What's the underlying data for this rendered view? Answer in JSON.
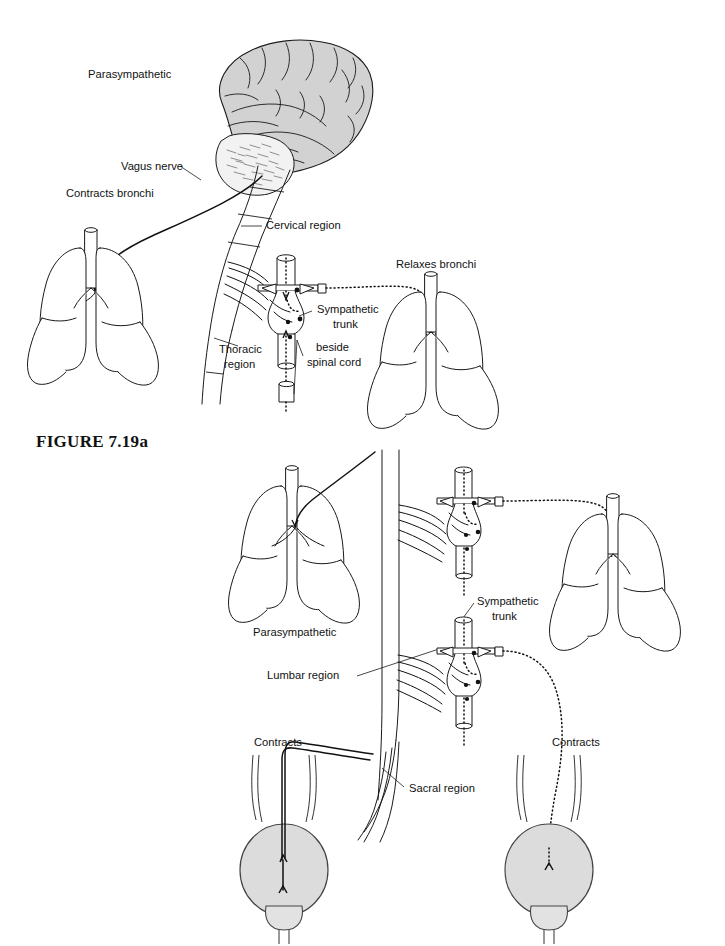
{
  "figure": {
    "caption": "FIGURE 7.19a",
    "caption_x": 36,
    "caption_y": 441
  },
  "panel_top": {
    "name": "respiratory-autonomic-panel",
    "labels": [
      {
        "id": "parasympathetic",
        "text": "Parasympathetic",
        "x": 88,
        "y": 75,
        "anchor": "start"
      },
      {
        "id": "vagus-nerve",
        "text": "Vagus nerve",
        "x": 121,
        "y": 167,
        "anchor": "start"
      },
      {
        "id": "contracts-bronchi",
        "text": "Contracts bronchi",
        "x": 66,
        "y": 194,
        "anchor": "start"
      },
      {
        "id": "cervical-region",
        "text": "Cervical region",
        "x": 266,
        "y": 226,
        "anchor": "start"
      },
      {
        "id": "thoracic-region-1",
        "text": "Thoracic",
        "x": 219,
        "y": 350,
        "anchor": "start"
      },
      {
        "id": "thoracic-region-2",
        "text": "region",
        "x": 224,
        "y": 365,
        "anchor": "start"
      },
      {
        "id": "relaxes-bronchi",
        "text": "Relaxes bronchi",
        "x": 396,
        "y": 265,
        "anchor": "start"
      },
      {
        "id": "sympathetic-trunk-1",
        "text": "Sympathetic",
        "x": 317,
        "y": 310,
        "anchor": "start"
      },
      {
        "id": "sympathetic-trunk-2",
        "text": "trunk",
        "x": 333,
        "y": 325,
        "anchor": "start"
      },
      {
        "id": "beside-spinal-1",
        "text": "beside",
        "x": 316,
        "y": 348,
        "anchor": "start"
      },
      {
        "id": "beside-spinal-2",
        "text": "spinal cord",
        "x": 307,
        "y": 363,
        "anchor": "start"
      }
    ]
  },
  "panel_bottom": {
    "name": "urinary-autonomic-panel",
    "labels": [
      {
        "id": "parasympathetic-b",
        "text": "Parasympathetic",
        "x": 253,
        "y": 633,
        "anchor": "start"
      },
      {
        "id": "lumbar-region",
        "text": "Lumbar region",
        "x": 267,
        "y": 676,
        "anchor": "start"
      },
      {
        "id": "sacral-region",
        "text": "Sacral region",
        "x": 409,
        "y": 789,
        "anchor": "start"
      },
      {
        "id": "contracts-left",
        "text": "Contracts",
        "x": 254,
        "y": 743,
        "anchor": "start"
      },
      {
        "id": "contracts-right",
        "text": "Contracts",
        "x": 552,
        "y": 743,
        "anchor": "start"
      },
      {
        "id": "sympathetic-trunk-b1",
        "text": "Sympathetic",
        "x": 477,
        "y": 602,
        "anchor": "start"
      },
      {
        "id": "sympathetic-trunk-b2",
        "text": "trunk",
        "x": 492,
        "y": 617,
        "anchor": "start"
      }
    ]
  },
  "colors": {
    "ink": "#111111",
    "brain_fill": "#d2d2d2",
    "bladder_fill": "#dcdcdc",
    "organ_fill": "#ffffff",
    "background": "#ffffff"
  },
  "icons": {
    "brain": "brain-icon",
    "cerebellum": "cerebellum-icon",
    "lung": "lung-icon",
    "bladder": "bladder-icon",
    "spinal_cord": "spinal-cord-icon",
    "ganglion": "ganglion-icon",
    "nerve_solid": "solid-nerve-path-icon",
    "nerve_dotted": "dotted-nerve-path-icon"
  }
}
